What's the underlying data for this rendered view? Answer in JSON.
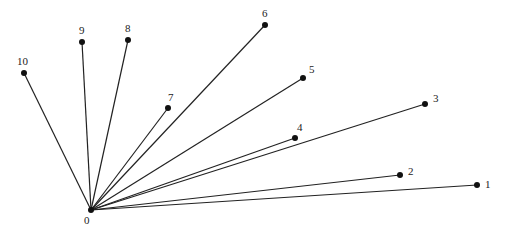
{
  "diagram": {
    "type": "star-graph",
    "line_color": "#222222",
    "node_color": "#111111",
    "center": {
      "id": "0",
      "label": "0",
      "x": 91,
      "y": 210,
      "label_dx": -7,
      "label_dy": 14
    },
    "nodes": [
      {
        "id": "1",
        "label": "1",
        "x": 477,
        "y": 185,
        "label_dx": 8,
        "label_dy": 3
      },
      {
        "id": "2",
        "label": "2",
        "x": 400,
        "y": 175,
        "label_dx": 8,
        "label_dy": 0
      },
      {
        "id": "3",
        "label": "3",
        "x": 425,
        "y": 104,
        "label_dx": 8,
        "label_dy": -2
      },
      {
        "id": "4",
        "label": "4",
        "x": 295,
        "y": 138,
        "label_dx": 2,
        "label_dy": -7
      },
      {
        "id": "5",
        "label": "5",
        "x": 303,
        "y": 78,
        "label_dx": 6,
        "label_dy": -5
      },
      {
        "id": "6",
        "label": "6",
        "x": 265,
        "y": 25,
        "label_dx": -3,
        "label_dy": -8
      },
      {
        "id": "7",
        "label": "7",
        "x": 168,
        "y": 108,
        "label_dx": 0,
        "label_dy": -7
      },
      {
        "id": "8",
        "label": "8",
        "x": 128,
        "y": 40,
        "label_dx": -3,
        "label_dy": -8
      },
      {
        "id": "9",
        "label": "9",
        "x": 82,
        "y": 42,
        "label_dx": -3,
        "label_dy": -8
      },
      {
        "id": "10",
        "label": "10",
        "x": 24,
        "y": 73,
        "label_dx": -7,
        "label_dy": -8
      }
    ]
  }
}
